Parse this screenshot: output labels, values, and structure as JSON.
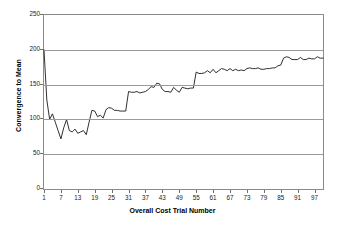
{
  "chart_data": {
    "type": "line",
    "title": "",
    "xlabel": "Overall Cost Trial Number",
    "ylabel": "Convergence to Mean",
    "xlim": [
      1,
      100
    ],
    "ylim": [
      0,
      250
    ],
    "grid": true,
    "legend": "none",
    "ytick_labels": [
      "0",
      "50",
      "100",
      "150",
      "200",
      "250"
    ],
    "ytick_values": [
      0,
      50,
      100,
      150,
      200,
      250
    ],
    "xtick_labels": [
      "1",
      "7",
      "13",
      "19",
      "25",
      "31",
      "37",
      "43",
      "49",
      "55",
      "61",
      "67",
      "73",
      "79",
      "85",
      "91",
      "97"
    ],
    "xtick_values": [
      1,
      7,
      13,
      19,
      25,
      31,
      37,
      43,
      49,
      55,
      61,
      67,
      73,
      79,
      85,
      91,
      97
    ],
    "line_color": "#1a1a1a",
    "grid_color": "#9a9a9a",
    "series": [
      {
        "name": "Convergence to Mean",
        "x": [
          1,
          2,
          3,
          4,
          5,
          6,
          7,
          8,
          9,
          10,
          11,
          12,
          13,
          14,
          15,
          16,
          17,
          18,
          19,
          20,
          21,
          22,
          23,
          24,
          25,
          26,
          27,
          28,
          29,
          30,
          31,
          32,
          33,
          34,
          35,
          36,
          37,
          38,
          39,
          40,
          41,
          42,
          43,
          44,
          45,
          46,
          47,
          48,
          49,
          50,
          51,
          52,
          53,
          54,
          55,
          56,
          57,
          58,
          59,
          60,
          61,
          62,
          63,
          64,
          65,
          66,
          67,
          68,
          69,
          70,
          71,
          72,
          73,
          74,
          75,
          76,
          77,
          78,
          79,
          80,
          81,
          82,
          83,
          84,
          85,
          86,
          87,
          88,
          89,
          90,
          91,
          92,
          93,
          94,
          95,
          96,
          97,
          98,
          99,
          100
        ],
        "values": [
          200,
          128,
          100,
          108,
          96,
          84,
          72,
          88,
          100,
          84,
          82,
          86,
          80,
          82,
          84,
          78,
          96,
          113,
          112,
          104,
          106,
          102,
          114,
          117,
          116,
          113,
          113,
          112,
          112,
          112,
          140,
          139,
          139,
          140,
          138,
          139,
          140,
          143,
          147,
          146,
          152,
          151,
          143,
          140,
          140,
          139,
          146,
          142,
          139,
          146,
          145,
          144,
          145,
          145,
          168,
          166,
          166,
          167,
          170,
          167,
          172,
          167,
          170,
          173,
          172,
          170,
          173,
          170,
          172,
          170,
          171,
          170,
          173,
          174,
          173,
          173,
          174,
          172,
          172,
          173,
          173,
          174,
          174,
          177,
          178,
          188,
          190,
          189,
          186,
          186,
          186,
          189,
          186,
          186,
          188,
          187,
          187,
          190,
          188,
          188
        ]
      }
    ]
  }
}
